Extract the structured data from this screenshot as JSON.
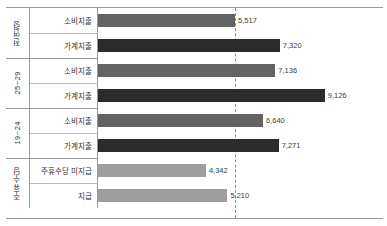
{
  "chart_data": {
    "type": "bar",
    "orientation": "horizontal",
    "title": "",
    "xlabel": "",
    "ylabel": "",
    "xlim": [
      0,
      10000
    ],
    "grid": false,
    "legend": "none",
    "reference_line": {
      "value": 5517,
      "style": "dashed",
      "color": "#8f8f8f"
    },
    "groups": [
      {
        "category": "전연령",
        "rows": [
          {
            "label": "소비지출",
            "value": 5517,
            "value_text": "5,517",
            "color": "#636363"
          },
          {
            "label": "가계지출",
            "value": 7320,
            "value_text": "7,320",
            "color": "#2b2b2b"
          }
        ]
      },
      {
        "category": "25~29",
        "rows": [
          {
            "label": "소비지출",
            "value": 7136,
            "value_text": "7,136",
            "color": "#636363"
          },
          {
            "label": "가계지출",
            "value": 9126,
            "value_text": "9,126",
            "color": "#2b2b2b"
          }
        ]
      },
      {
        "category": "19~24",
        "rows": [
          {
            "label": "소비지출",
            "value": 6640,
            "value_text": "6,640",
            "color": "#636363"
          },
          {
            "label": "가계지출",
            "value": 7271,
            "value_text": "7,271",
            "color": "#2b2b2b"
          }
        ]
      },
      {
        "category": "주휴수당",
        "rows": [
          {
            "label": "주휴수당 미지급",
            "value": 4342,
            "value_text": "4,342",
            "color": "#9e9e9e"
          },
          {
            "label": "지급",
            "value": 5210,
            "value_text": "5,210",
            "color": "#9e9e9e"
          }
        ]
      }
    ]
  }
}
